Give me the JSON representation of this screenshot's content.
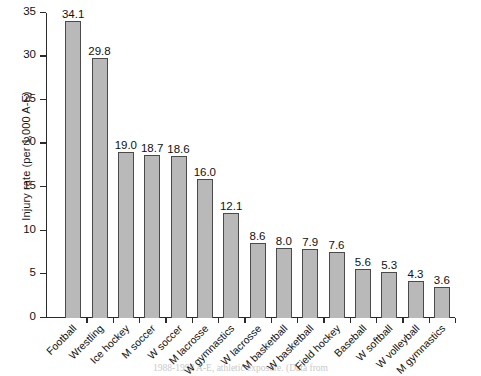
{
  "chart_data": {
    "type": "bar",
    "title": "",
    "xlabel": "",
    "ylabel": "Injury rate (per 1,000 A-E)",
    "ylim": [
      0,
      35
    ],
    "ytick_values": [
      0,
      5,
      10,
      15,
      20,
      25,
      30,
      35
    ],
    "ytick_labels": [
      "0",
      "5",
      "10",
      "15",
      "20",
      "25",
      "30",
      "35"
    ],
    "grid": false,
    "legend": "none",
    "categories": [
      "Football",
      "Wrestling",
      "Ice hockey",
      "M soccer",
      "W soccer",
      "M lacrosse",
      "W gymnastics",
      "W lacrosse",
      "M basketball",
      "W basketball",
      "Field hockey",
      "Baseball",
      "W softball",
      "W volleyball",
      "M gymnastics"
    ],
    "values": [
      34.1,
      29.8,
      19.0,
      18.7,
      18.6,
      16.0,
      12.1,
      8.6,
      8.0,
      7.9,
      7.6,
      5.6,
      5.3,
      4.3,
      3.6
    ],
    "value_labels": [
      "34.1",
      "29.8",
      "19.0",
      "18.7",
      "18.6",
      "16.0",
      "12.1",
      "8.6",
      "8.0",
      "7.9",
      "7.6",
      "5.6",
      "5.3",
      "4.3",
      "3.6"
    ],
    "bar_fill_color": "#b9b9b9",
    "bar_edge_color": "#4a4a4a"
  },
  "caption": {
    "fragment": "1988-1998        A-E, athletic exposure. (Data from"
  }
}
